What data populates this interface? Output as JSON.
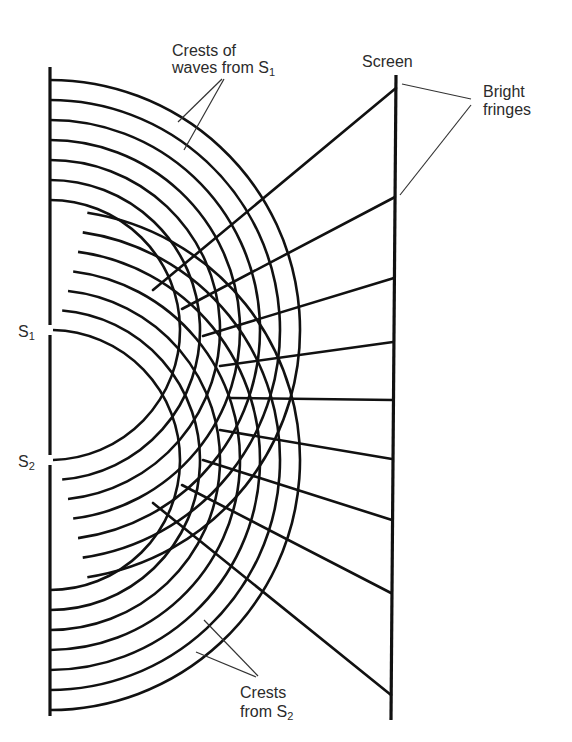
{
  "labels": {
    "crests_s1_line1": "Crests of",
    "crests_s1_line2": "waves from S",
    "crests_s1_sub": "1",
    "screen": "Screen",
    "bright_line1": "Bright",
    "bright_line2": "fringes",
    "s1": "S",
    "s1_sub": "1",
    "s2": "S",
    "s2_sub": "2",
    "crests_s2_line1": "Crests",
    "crests_s2_line2": "from S",
    "crests_s2_sub": "2"
  },
  "geometry": {
    "barrier": {
      "x": 50,
      "top": 67,
      "bottom": 716,
      "slit_half_gap": 5
    },
    "sources": [
      {
        "name": "S1",
        "x": 50,
        "y": 330
      },
      {
        "name": "S2",
        "x": 50,
        "y": 460
      }
    ],
    "wave_radii": [
      130,
      150,
      170,
      190,
      210,
      230,
      250
    ],
    "lens_offset": 127,
    "screen": {
      "x_top": 396,
      "y_top": 75,
      "x_bottom": 391,
      "y_bottom": 720
    },
    "bright_fringes_y": [
      88,
      197,
      278,
      342,
      400,
      459,
      520,
      593,
      695
    ],
    "rays": [
      {
        "from": [
          153,
          290
        ],
        "to": [
          396,
          88
        ]
      },
      {
        "from": [
          182,
          309
        ],
        "to": [
          395,
          197
        ]
      },
      {
        "from": [
          203,
          336
        ],
        "to": [
          394,
          278
        ]
      },
      {
        "from": [
          220,
          366
        ],
        "to": [
          393,
          342
        ]
      },
      {
        "from": [
          230,
          398
        ],
        "to": [
          393,
          400
        ]
      },
      {
        "from": [
          220,
          430
        ],
        "to": [
          392,
          459
        ]
      },
      {
        "from": [
          203,
          460
        ],
        "to": [
          392,
          520
        ]
      },
      {
        "from": [
          182,
          485
        ],
        "to": [
          391,
          593
        ]
      },
      {
        "from": [
          153,
          503
        ],
        "to": [
          391,
          695
        ]
      }
    ],
    "leaders": [
      {
        "from": [
          222,
          79
        ],
        "to": [
          178,
          122
        ]
      },
      {
        "from": [
          224,
          79
        ],
        "to": [
          184,
          150
        ]
      },
      {
        "from": [
          402,
          84
        ],
        "to": [
          471,
          99
        ]
      },
      {
        "from": [
          400,
          195
        ],
        "to": [
          471,
          105
        ]
      },
      {
        "from": [
          204,
          620
        ],
        "to": [
          258,
          676
        ]
      },
      {
        "from": [
          196,
          652
        ],
        "to": [
          256,
          677
        ]
      }
    ]
  }
}
